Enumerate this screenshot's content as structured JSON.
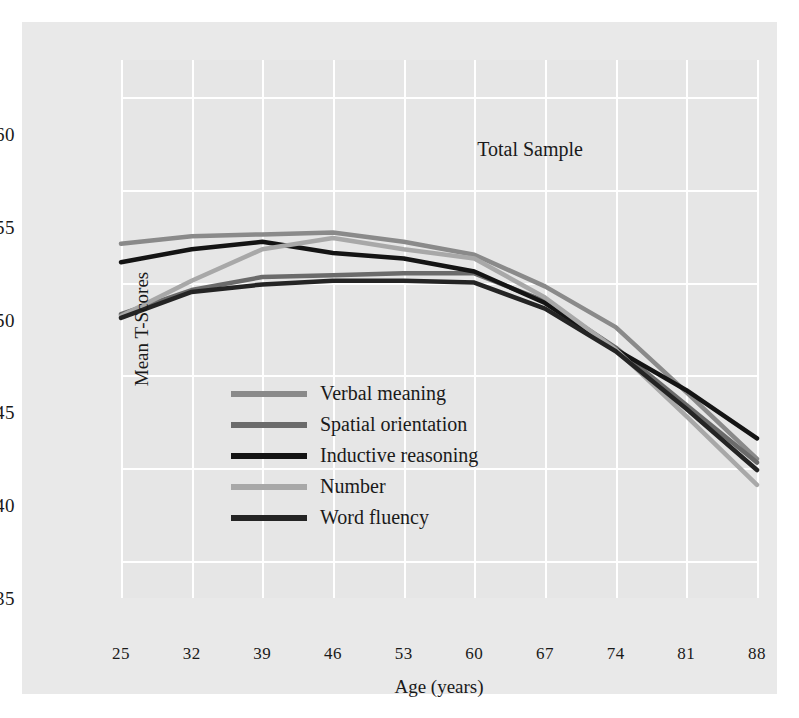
{
  "chart_data": {
    "type": "line",
    "title": "",
    "annotation": "Total Sample",
    "xlabel": "Age (years)",
    "ylabel": "Mean T-Scores",
    "x": [
      25,
      32,
      39,
      46,
      53,
      60,
      67,
      74,
      81,
      88
    ],
    "xticklabels": [
      "25",
      "32",
      "39",
      "46",
      "53",
      "60",
      "67",
      "74",
      "81",
      "88"
    ],
    "yticks": [
      35,
      40,
      45,
      50,
      55,
      60
    ],
    "yticklabels": [
      "35",
      "40",
      "45",
      "50",
      "55",
      "60"
    ],
    "xlim": [
      25,
      88
    ],
    "ylim": [
      33,
      62
    ],
    "grid": true,
    "legend_position": "center-left-inside",
    "series": [
      {
        "name": "Verbal meaning",
        "color": "#8a8a8a",
        "values": [
          52.1,
          52.5,
          52.6,
          52.7,
          52.2,
          51.5,
          49.8,
          47.6,
          44.1,
          40.5
        ]
      },
      {
        "name": "Spatial orientation",
        "color": "#6b6b6b",
        "values": [
          48.3,
          49.6,
          50.3,
          50.4,
          50.5,
          50.5,
          49.0,
          46.5,
          43.4,
          40.3
        ]
      },
      {
        "name": "Inductive reasoning",
        "color": "#141414",
        "values": [
          51.1,
          51.8,
          52.2,
          51.6,
          51.3,
          50.6,
          48.9,
          46.4,
          44.2,
          41.6
        ]
      },
      {
        "name": "Number",
        "color": "#a8a8a8",
        "values": [
          48.2,
          50.1,
          51.8,
          52.4,
          51.8,
          51.3,
          49.2,
          46.4,
          42.8,
          39.1
        ]
      },
      {
        "name": "Word fluency",
        "color": "#242424",
        "values": [
          48.1,
          49.5,
          49.9,
          50.1,
          50.1,
          50.0,
          48.6,
          46.3,
          43.2,
          39.9
        ]
      }
    ]
  },
  "legend": {
    "items": [
      {
        "label": "Verbal meaning",
        "color": "#8a8a8a"
      },
      {
        "label": "Spatial orientation",
        "color": "#6b6b6b"
      },
      {
        "label": "Inductive reasoning",
        "color": "#141414"
      },
      {
        "label": "Number",
        "color": "#a8a8a8"
      },
      {
        "label": "Word fluency",
        "color": "#242424"
      }
    ]
  }
}
